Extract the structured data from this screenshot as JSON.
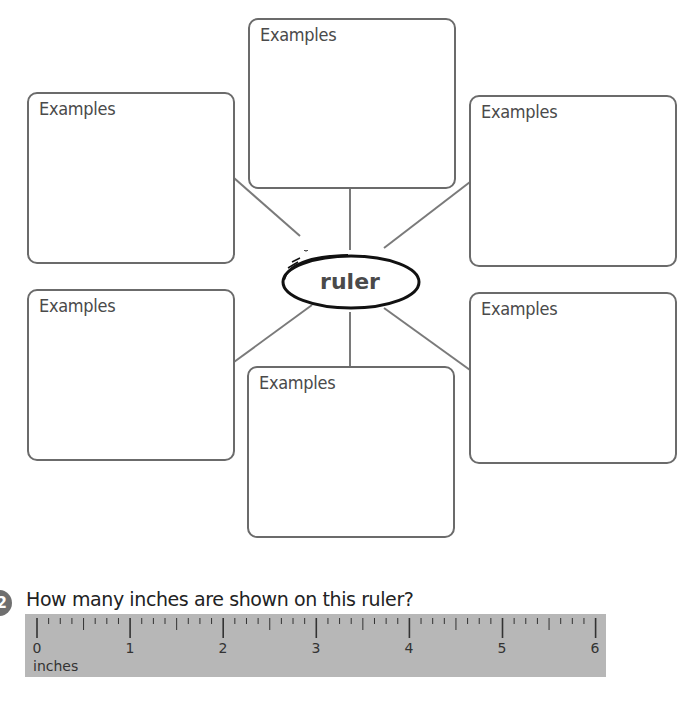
{
  "web": {
    "center_word": "ruler",
    "boxes": [
      {
        "position": "top-center",
        "label": "Examples"
      },
      {
        "position": "upper-left",
        "label": "Examples"
      },
      {
        "position": "upper-right",
        "label": "Examples"
      },
      {
        "position": "lower-left",
        "label": "Examples"
      },
      {
        "position": "lower-right",
        "label": "Examples"
      },
      {
        "position": "bottom-center",
        "label": "Examples"
      }
    ]
  },
  "question": {
    "number": "2",
    "text": "How many inches are shown on this ruler?"
  },
  "ruler": {
    "numbers": [
      "0",
      "1",
      "2",
      "3",
      "4",
      "5",
      "6"
    ],
    "unit": "inches",
    "subdivisions_per_inch": 8,
    "color": "#b7b7b7"
  }
}
